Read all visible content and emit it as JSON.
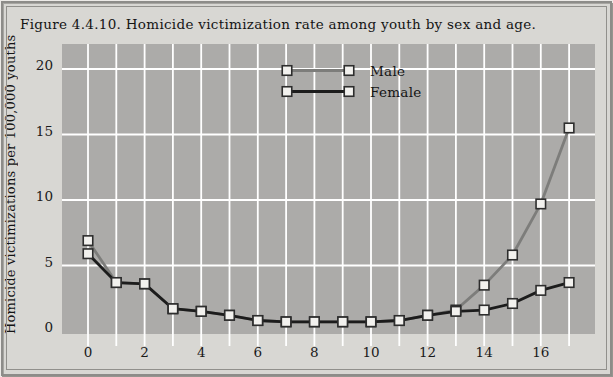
{
  "figure": {
    "title": "Figure 4.4.10. Homicide victimization rate among youth by sex and age."
  },
  "chart_data": {
    "type": "line",
    "title": "Figure 4.4.10. Homicide victimization rate among youth by sex and age.",
    "xlabel": "",
    "ylabel": "Homicide victimizations per 100,000 youths",
    "x": [
      0,
      1,
      2,
      3,
      4,
      5,
      6,
      7,
      8,
      9,
      10,
      11,
      12,
      13,
      14,
      15,
      16,
      17
    ],
    "x_tick_labels": [
      0,
      2,
      4,
      6,
      8,
      10,
      12,
      14,
      16
    ],
    "y_ticks": [
      0,
      5,
      10,
      15,
      20
    ],
    "xlim": [
      -0.9,
      17.9
    ],
    "ylim": [
      0,
      22
    ],
    "grid": "white gridlines on gray plot area; vertical every 1 year, horizontal every 5 units",
    "legend_position": "top-center-inside",
    "series": [
      {
        "name": "Male",
        "color": "#7d7d7b",
        "values": [
          6.9,
          3.7,
          3.6,
          1.7,
          1.5,
          1.2,
          0.8,
          0.7,
          0.7,
          0.7,
          0.7,
          0.8,
          1.2,
          1.6,
          3.5,
          5.8,
          9.7,
          15.5
        ]
      },
      {
        "name": "Female",
        "color": "#1c1c1c",
        "values": [
          5.9,
          3.7,
          3.6,
          1.7,
          1.5,
          1.2,
          0.8,
          0.7,
          0.7,
          0.7,
          0.7,
          0.8,
          1.2,
          1.5,
          1.6,
          2.1,
          3.1,
          3.7
        ]
      }
    ],
    "marker": {
      "shape": "square",
      "fill": "#f2f1ee",
      "border": "#2d2d2d"
    }
  },
  "colors": {
    "figure_bg": "#d8d7d3",
    "plot_bg": "#acaba9",
    "gridline": "#ffffff",
    "frame_border": "#8d8c89",
    "text": "#141414"
  }
}
